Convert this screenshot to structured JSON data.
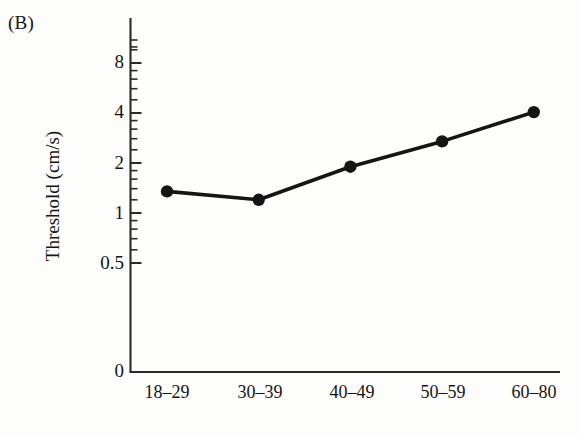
{
  "figure": {
    "panel_label": "(B)",
    "background_color": "#fdfdfc",
    "ink_color": "#151515"
  },
  "chart_data": {
    "type": "line",
    "title": "",
    "subtitle": "",
    "panel": "(B)",
    "xlabel": "Age group (years)",
    "ylabel": "Threshold (cm/s)",
    "categories": [
      "18–29",
      "30–39",
      "40–49",
      "50–59",
      "60–80"
    ],
    "values": [
      1.35,
      1.2,
      1.9,
      2.7,
      4.05
    ],
    "series": [
      {
        "name": "Threshold",
        "values": [
          1.35,
          1.2,
          1.9,
          2.7,
          4.05
        ],
        "marker": "filled-circle",
        "line_color": "#151515",
        "marker_color": "#151515"
      }
    ],
    "yscale": "log",
    "ylim": [
      0.5,
      10
    ],
    "y_axis_broken_to_zero": true,
    "yticks": [
      0.5,
      1,
      2,
      4,
      8
    ],
    "ytick_labels": [
      "0.5",
      "1",
      "2",
      "4",
      "8"
    ],
    "y_zero_tick_label": "0",
    "y_minor_ticks": [
      0.6,
      0.7,
      0.8,
      0.9,
      1.2,
      1.4,
      1.6,
      1.8,
      2.4,
      2.8,
      3.2,
      3.6,
      4.8,
      5.6,
      6.4,
      7.2,
      9.6
    ],
    "xtick_labels": [
      "18–29",
      "30–39",
      "40–49",
      "50–59",
      "60–80"
    ],
    "grid": false,
    "legend": null,
    "legend_position": "none",
    "annotations": []
  },
  "axis": {
    "y_labels": [
      {
        "text": "8",
        "top": 52
      },
      {
        "text": "4",
        "top": 102
      },
      {
        "text": "2",
        "top": 153
      },
      {
        "text": "1",
        "top": 203
      },
      {
        "text": "0.5",
        "top": 253
      },
      {
        "text": "0",
        "top": 361
      }
    ],
    "x_labels": [
      {
        "text": "18–29",
        "left": 122
      },
      {
        "text": "30–39",
        "left": 215
      },
      {
        "text": "40–49",
        "left": 307
      },
      {
        "text": "50–59",
        "left": 398
      },
      {
        "text": "60–80",
        "left": 489
      }
    ]
  }
}
